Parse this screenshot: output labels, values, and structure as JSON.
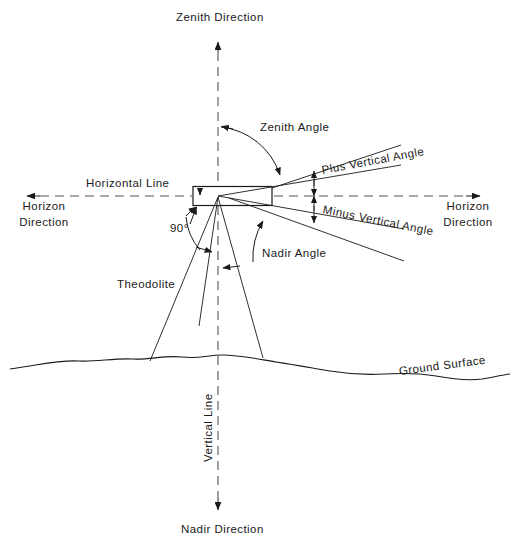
{
  "diagram": {
    "labels": {
      "zenith_direction": "Zenith Direction",
      "zenith_angle": "Zenith Angle",
      "horizontal_line": "Horizontal Line",
      "horizon_direction_left": "Horizon\nDirection",
      "horizon_direction_left_line1": "Horizon",
      "horizon_direction_left_line2": "Direction",
      "horizon_direction_right_line1": "Horizon",
      "horizon_direction_right_line2": "Direction",
      "plus_vertical_angle": "Plus Vertical Angle",
      "minus_vertical_angle": "Minus Vertical Angle",
      "right_angle": "90°",
      "nadir_angle": "Nadir Angle",
      "theodolite": "Theodolite",
      "ground_surface": "Ground Surface",
      "vertical_line": "Vertical Line",
      "nadir_direction": "Nadir Direction"
    },
    "colors": {
      "stroke": "#1a1a1a",
      "axis_stroke": "#555555",
      "background": "#ffffff",
      "text": "#1a1a1a"
    },
    "geometry": {
      "instrument_vertex_x": 218,
      "instrument_vertex_y": 196,
      "horizontal_line_y": 196,
      "vertical_line_x": 218,
      "plus_angle_degrees": 9,
      "minus_angle_degrees": 10,
      "right_angle_degrees": 90
    }
  }
}
